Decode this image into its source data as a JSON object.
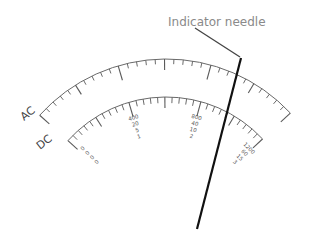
{
  "callout": {
    "label": "Indicator needle"
  },
  "scales": [
    {
      "id": "ac",
      "label": "AC",
      "minor_divisions": 30,
      "major_every": 5
    },
    {
      "id": "dc",
      "label": "DC",
      "minor_divisions": 30,
      "major_every": 5
    }
  ],
  "range_columns": [
    {
      "position": "start",
      "values": [
        "0",
        "0",
        "0",
        "0"
      ]
    },
    {
      "position": "one-third",
      "values": [
        "400",
        "20",
        "5",
        "1"
      ]
    },
    {
      "position": "two-thirds",
      "values": [
        "800",
        "40",
        "10",
        "2"
      ]
    },
    {
      "position": "end",
      "values": [
        "1200",
        "60",
        "15",
        "3"
      ]
    }
  ],
  "needle": {
    "reading_fraction_dc": 0.78
  },
  "colors": {
    "needle": "#111111",
    "scale": "#6a6a6a",
    "callout_text": "#8a8a8a"
  }
}
